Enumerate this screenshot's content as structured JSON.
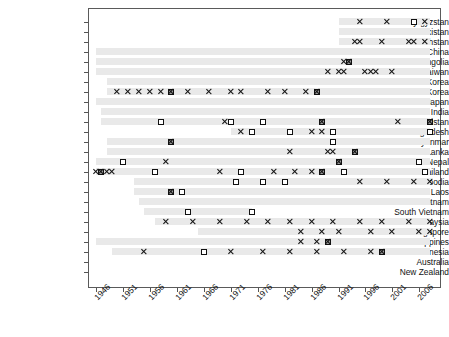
{
  "chart_data": {
    "type": "scatter",
    "title": "",
    "xlabel": "",
    "ylabel": "",
    "xlim": [
      1944,
      2010
    ],
    "xticks": [
      1946,
      1951,
      1956,
      1961,
      1966,
      1971,
      1976,
      1981,
      1986,
      1991,
      1996,
      2001,
      2006
    ],
    "xtick_labels": [
      "1946",
      "1951",
      "1956",
      "1961",
      "1966",
      "1971",
      "1976",
      "1981",
      "1986",
      "1991",
      "1996",
      "2001",
      "2006"
    ],
    "categories": [
      "Kyrgyzstan",
      "Uzbekistan",
      "Kazakhstan",
      "China",
      "Mongolia",
      "Taiwan",
      "North Korea",
      "South Korea",
      "Japan",
      "India",
      "Pakistan",
      "Bangladesh",
      "Myanmar",
      "Sri Lanka",
      "Nepal",
      "Thailand",
      "Cambodia",
      "Laos",
      "Vietnam",
      "South Vietnam",
      "Malaysia",
      "Singapore",
      "Philippines",
      "Indonesia",
      "Australia",
      "New Zealand"
    ],
    "grid": false,
    "legend_position": "none",
    "marker_types": {
      "cross": "x-marker",
      "square": "open-square-marker",
      "filled": "filled-square-marker"
    },
    "series": [
      {
        "name": "Kyrgyzstan",
        "band": [
          1991,
          2008
        ],
        "points": [
          {
            "x": 1995,
            "m": "cross"
          },
          {
            "x": 2000,
            "m": "cross"
          },
          {
            "x": 2005,
            "m": "square"
          },
          {
            "x": 2007,
            "m": "cross"
          }
        ]
      },
      {
        "name": "Uzbekistan",
        "band": [
          1991,
          2008
        ],
        "points": []
      },
      {
        "name": "Kazakhstan",
        "band": [
          1991,
          2008
        ],
        "points": [
          {
            "x": 1994,
            "m": "cross"
          },
          {
            "x": 1995,
            "m": "cross"
          },
          {
            "x": 1999,
            "m": "cross"
          },
          {
            "x": 2004,
            "m": "cross"
          },
          {
            "x": 2005,
            "m": "cross"
          },
          {
            "x": 2007,
            "m": "cross"
          }
        ]
      },
      {
        "name": "China",
        "band": [
          1946,
          2008
        ],
        "points": []
      },
      {
        "name": "Mongolia",
        "band": [
          1946,
          2008
        ],
        "points": [
          {
            "x": 1992,
            "m": "cross"
          },
          {
            "x": 1993,
            "m": "filled"
          }
        ]
      },
      {
        "name": "Taiwan",
        "band": [
          1946,
          2008
        ],
        "points": [
          {
            "x": 1989,
            "m": "cross"
          },
          {
            "x": 1991,
            "m": "cross"
          },
          {
            "x": 1992,
            "m": "cross"
          },
          {
            "x": 1996,
            "m": "cross"
          },
          {
            "x": 1997,
            "m": "cross"
          },
          {
            "x": 1998,
            "m": "cross"
          },
          {
            "x": 2001,
            "m": "cross"
          }
        ]
      },
      {
        "name": "North Korea",
        "band": [
          1948,
          2008
        ],
        "points": []
      },
      {
        "name": "South Korea",
        "band": [
          1948,
          2008
        ],
        "points": [
          {
            "x": 1950,
            "m": "cross"
          },
          {
            "x": 1952,
            "m": "cross"
          },
          {
            "x": 1954,
            "m": "cross"
          },
          {
            "x": 1956,
            "m": "cross"
          },
          {
            "x": 1958,
            "m": "cross"
          },
          {
            "x": 1960,
            "m": "filled"
          },
          {
            "x": 1963,
            "m": "cross"
          },
          {
            "x": 1967,
            "m": "cross"
          },
          {
            "x": 1971,
            "m": "cross"
          },
          {
            "x": 1973,
            "m": "cross"
          },
          {
            "x": 1978,
            "m": "cross"
          },
          {
            "x": 1981,
            "m": "cross"
          },
          {
            "x": 1985,
            "m": "cross"
          },
          {
            "x": 1987,
            "m": "filled"
          }
        ]
      },
      {
        "name": "Japan",
        "band": [
          1946,
          2008
        ],
        "points": []
      },
      {
        "name": "India",
        "band": [
          1947,
          2008
        ],
        "points": []
      },
      {
        "name": "Pakistan",
        "band": [
          1947,
          2008
        ],
        "points": [
          {
            "x": 1958,
            "m": "square"
          },
          {
            "x": 1970,
            "m": "cross"
          },
          {
            "x": 1971,
            "m": "square"
          },
          {
            "x": 1977,
            "m": "square"
          },
          {
            "x": 1988,
            "m": "filled"
          },
          {
            "x": 2002,
            "m": "cross"
          },
          {
            "x": 2008,
            "m": "filled"
          }
        ]
      },
      {
        "name": "Bangladesh",
        "band": [
          1971,
          2008
        ],
        "points": [
          {
            "x": 1973,
            "m": "cross"
          },
          {
            "x": 1975,
            "m": "square"
          },
          {
            "x": 1982,
            "m": "square"
          },
          {
            "x": 1986,
            "m": "cross"
          },
          {
            "x": 1988,
            "m": "cross"
          },
          {
            "x": 1990,
            "m": "square"
          },
          {
            "x": 2008,
            "m": "square"
          }
        ]
      },
      {
        "name": "Myanmar",
        "band": [
          1948,
          2008
        ],
        "points": [
          {
            "x": 1960,
            "m": "filled"
          },
          {
            "x": 1990,
            "m": "square"
          }
        ]
      },
      {
        "name": "Sri Lanka",
        "band": [
          1948,
          2008
        ],
        "points": [
          {
            "x": 1982,
            "m": "cross"
          },
          {
            "x": 1989,
            "m": "cross"
          },
          {
            "x": 1990,
            "m": "cross"
          },
          {
            "x": 1994,
            "m": "filled"
          }
        ]
      },
      {
        "name": "Nepal",
        "band": [
          1946,
          2008
        ],
        "points": [
          {
            "x": 1951,
            "m": "square"
          },
          {
            "x": 1959,
            "m": "cross"
          },
          {
            "x": 1991,
            "m": "filled"
          },
          {
            "x": 2006,
            "m": "square"
          }
        ]
      },
      {
        "name": "Thailand",
        "band": [
          1946,
          2008
        ],
        "points": [
          {
            "x": 1946,
            "m": "cross"
          },
          {
            "x": 1947,
            "m": "filled"
          },
          {
            "x": 1948,
            "m": "cross"
          },
          {
            "x": 1949,
            "m": "cross"
          },
          {
            "x": 1957,
            "m": "square"
          },
          {
            "x": 1969,
            "m": "cross"
          },
          {
            "x": 1973,
            "m": "square"
          },
          {
            "x": 1979,
            "m": "cross"
          },
          {
            "x": 1983,
            "m": "cross"
          },
          {
            "x": 1986,
            "m": "cross"
          },
          {
            "x": 1988,
            "m": "filled"
          },
          {
            "x": 1992,
            "m": "square"
          },
          {
            "x": 2007,
            "m": "square"
          }
        ]
      },
      {
        "name": "Cambodia",
        "band": [
          1953,
          2008
        ],
        "points": [
          {
            "x": 1972,
            "m": "square"
          },
          {
            "x": 1977,
            "m": "square"
          },
          {
            "x": 1981,
            "m": "square"
          },
          {
            "x": 1995,
            "m": "cross"
          },
          {
            "x": 2000,
            "m": "cross"
          },
          {
            "x": 2005,
            "m": "cross"
          },
          {
            "x": 2008,
            "m": "cross"
          }
        ]
      },
      {
        "name": "Laos",
        "band": [
          1953,
          2008
        ],
        "points": [
          {
            "x": 1960,
            "m": "filled"
          },
          {
            "x": 1962,
            "m": "square"
          }
        ]
      },
      {
        "name": "Vietnam",
        "band": [
          1954,
          2008
        ],
        "points": []
      },
      {
        "name": "South Vietnam",
        "band": [
          1955,
          1975
        ],
        "points": [
          {
            "x": 1963,
            "m": "square"
          },
          {
            "x": 1975,
            "m": "square"
          }
        ]
      },
      {
        "name": "Malaysia",
        "band": [
          1957,
          2008
        ],
        "points": [
          {
            "x": 1959,
            "m": "cross"
          },
          {
            "x": 1964,
            "m": "cross"
          },
          {
            "x": 1969,
            "m": "cross"
          },
          {
            "x": 1974,
            "m": "cross"
          },
          {
            "x": 1978,
            "m": "cross"
          },
          {
            "x": 1982,
            "m": "cross"
          },
          {
            "x": 1986,
            "m": "cross"
          },
          {
            "x": 1990,
            "m": "cross"
          },
          {
            "x": 1995,
            "m": "cross"
          },
          {
            "x": 1999,
            "m": "cross"
          },
          {
            "x": 2004,
            "m": "cross"
          },
          {
            "x": 2008,
            "m": "cross"
          }
        ]
      },
      {
        "name": "Singapore",
        "band": [
          1965,
          2008
        ],
        "points": [
          {
            "x": 1984,
            "m": "cross"
          },
          {
            "x": 1988,
            "m": "cross"
          },
          {
            "x": 1991,
            "m": "cross"
          },
          {
            "x": 1997,
            "m": "cross"
          },
          {
            "x": 2001,
            "m": "cross"
          },
          {
            "x": 2006,
            "m": "cross"
          },
          {
            "x": 2008,
            "m": "cross"
          }
        ]
      },
      {
        "name": "Philippines",
        "band": [
          1946,
          2008
        ],
        "points": [
          {
            "x": 1984,
            "m": "cross"
          },
          {
            "x": 1987,
            "m": "cross"
          },
          {
            "x": 1989,
            "m": "filled"
          }
        ]
      },
      {
        "name": "Indonesia",
        "band": [
          1949,
          2008
        ],
        "points": [
          {
            "x": 1955,
            "m": "cross"
          },
          {
            "x": 1966,
            "m": "square"
          },
          {
            "x": 1971,
            "m": "cross"
          },
          {
            "x": 1977,
            "m": "cross"
          },
          {
            "x": 1982,
            "m": "cross"
          },
          {
            "x": 1987,
            "m": "cross"
          },
          {
            "x": 1992,
            "m": "cross"
          },
          {
            "x": 1997,
            "m": "cross"
          },
          {
            "x": 1999,
            "m": "filled"
          }
        ]
      },
      {
        "name": "Australia",
        "band": [],
        "points": []
      },
      {
        "name": "New Zealand",
        "band": [],
        "points": []
      }
    ]
  }
}
